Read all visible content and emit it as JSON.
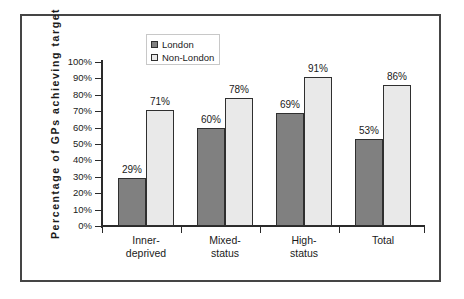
{
  "chart_data": {
    "type": "bar",
    "title": "",
    "xlabel": "",
    "ylabel": "Percentage of GPs achieving target",
    "categories": [
      "Inner-deprived",
      "Mixed-status",
      "High-status",
      "Total"
    ],
    "category_lines": [
      [
        "Inner-",
        "deprived"
      ],
      [
        "Mixed-",
        "status"
      ],
      [
        "High-",
        "status"
      ],
      [
        "Total",
        ""
      ]
    ],
    "series": [
      {
        "name": "London",
        "color": "#808080",
        "values": [
          29,
          60,
          69,
          53
        ],
        "labels": [
          "29%",
          "60%",
          "69%",
          "53%"
        ]
      },
      {
        "name": "Non-London",
        "color": "#e9e9e9",
        "values": [
          71,
          78,
          91,
          86
        ],
        "labels": [
          "71%",
          "78%",
          "91%",
          "86%"
        ]
      }
    ],
    "ylim": [
      0,
      100
    ],
    "ytick_values": [
      100,
      90,
      80,
      70,
      60,
      50,
      40,
      30,
      20,
      10,
      0
    ],
    "ytick_labels": [
      "100%",
      "90%",
      "80%",
      "70%",
      "60%",
      "50%",
      "40%",
      "30%",
      "20%",
      "10%",
      "0%"
    ],
    "grid": false,
    "legend_position": "top-left-inside",
    "legend_entries": [
      "London",
      "Non-London"
    ],
    "axis_color": "#2a2a2a",
    "frame_color": "#454545",
    "bar_border_color": "#2f2f2f"
  }
}
